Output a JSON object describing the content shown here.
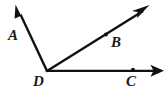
{
  "figure": {
    "kind": "geometry-diagram",
    "width": 168,
    "height": 96,
    "background_color": "#ffffff",
    "stroke_color": "#111111",
    "stroke_width": 2.2
  },
  "labels": {
    "a": "A",
    "b": "B",
    "c": "C",
    "d": "D"
  },
  "points": {
    "vertex": {
      "name": "D",
      "x": 47,
      "y": 71
    },
    "on_ray_db": {
      "name": "B",
      "x": 106,
      "y": 34
    },
    "on_ray_dc": {
      "name": "C",
      "x": 133,
      "y": 70
    }
  },
  "rays": [
    {
      "name": "ray-DA",
      "from": "D",
      "through": "A",
      "start": {
        "x": 47,
        "y": 71
      },
      "end": {
        "x": 17,
        "y": 10
      },
      "arrowhead": "end"
    },
    {
      "name": "ray-DB",
      "from": "D",
      "through": "B",
      "start": {
        "x": 47,
        "y": 71
      },
      "end": {
        "x": 146,
        "y": 9
      },
      "arrowhead": "end"
    },
    {
      "name": "ray-DC",
      "from": "D",
      "through": "C",
      "start": {
        "x": 47,
        "y": 71
      },
      "end": {
        "x": 161,
        "y": 71
      },
      "arrowhead": "end"
    }
  ]
}
